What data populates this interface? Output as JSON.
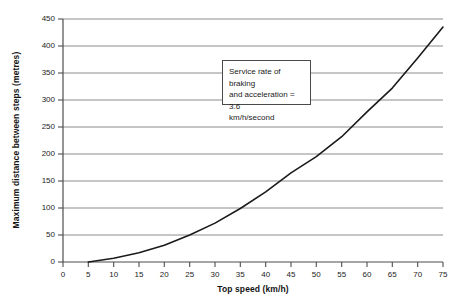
{
  "chart_data": {
    "type": "line",
    "title": "",
    "xlabel": "Top speed (km/h)",
    "ylabel": "Maximum distance between steps (metres)",
    "xlim": [
      0,
      75
    ],
    "ylim": [
      0,
      450
    ],
    "xticks": [
      0,
      5,
      10,
      15,
      20,
      25,
      30,
      35,
      40,
      45,
      50,
      55,
      60,
      65,
      70,
      75
    ],
    "yticks": [
      0,
      50,
      100,
      150,
      200,
      250,
      300,
      350,
      400,
      450
    ],
    "grid": "horizontal",
    "legend": "none",
    "series": [
      {
        "name": "Maximum distance between steps",
        "color": "#1a1a1a",
        "x": [
          5,
          10,
          15,
          20,
          25,
          30,
          35,
          40,
          45,
          50,
          55,
          60,
          65,
          70,
          75
        ],
        "y": [
          0,
          7,
          17,
          31,
          50,
          72,
          99,
          130,
          165,
          195,
          232,
          278,
          322,
          378,
          435
        ]
      }
    ],
    "annotations": [
      {
        "name": "service-rate-note",
        "text": "Service rate of braking and acceleration = 3.6 km/h/second",
        "x": 36,
        "y": 370
      }
    ]
  },
  "axes": {
    "y_title": "Maximum distance between steps (metres)",
    "x_title": "Top speed (km/h)",
    "y_tick_labels": [
      "450",
      "400",
      "350",
      "300",
      "250",
      "200",
      "150",
      "100",
      "50",
      "0"
    ],
    "x_tick_labels": [
      "0",
      "5",
      "10",
      "15",
      "20",
      "25",
      "30",
      "35",
      "40",
      "45",
      "50",
      "55",
      "60",
      "65",
      "70",
      "75"
    ]
  },
  "annotation": {
    "line1": "Service rate of braking",
    "line2": "and acceleration = 3.6",
    "line3": "km/h/second"
  },
  "colors": {
    "curve": "#1a1a1a",
    "grid": "#8c8c8c",
    "axis": "#4d4d4d",
    "background": "#ffffff"
  }
}
